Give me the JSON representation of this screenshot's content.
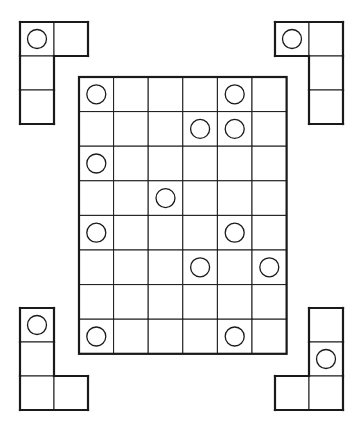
{
  "puzzle": {
    "main_grid": {
      "cols": 6,
      "rows": 8,
      "origin": [
        79,
        77
      ],
      "cell": 34.6,
      "circles": [
        [
          0,
          0
        ],
        [
          4,
          0
        ],
        [
          3,
          1
        ],
        [
          4,
          1
        ],
        [
          0,
          2
        ],
        [
          2,
          3
        ],
        [
          0,
          4
        ],
        [
          4,
          4
        ],
        [
          3,
          5
        ],
        [
          5,
          5
        ],
        [
          0,
          7
        ],
        [
          4,
          7
        ]
      ]
    },
    "pieces": [
      {
        "id": "piece-top-left",
        "origin": [
          20,
          22
        ],
        "cell": 34,
        "cells": [
          [
            0,
            0
          ],
          [
            1,
            0
          ],
          [
            0,
            1
          ],
          [
            0,
            2
          ]
        ],
        "circles": [
          [
            0,
            0
          ]
        ]
      },
      {
        "id": "piece-top-right",
        "origin": [
          275,
          22
        ],
        "cell": 34,
        "cells": [
          [
            0,
            0
          ],
          [
            1,
            0
          ],
          [
            1,
            1
          ],
          [
            1,
            2
          ]
        ],
        "circles": [
          [
            0,
            0
          ]
        ]
      },
      {
        "id": "piece-bottom-left",
        "origin": [
          20,
          308
        ],
        "cell": 34,
        "cells": [
          [
            0,
            0
          ],
          [
            0,
            1
          ],
          [
            0,
            2
          ],
          [
            1,
            2
          ]
        ],
        "circles": [
          [
            0,
            0
          ]
        ]
      },
      {
        "id": "piece-bottom-right",
        "origin": [
          275,
          308
        ],
        "cell": 34,
        "cells": [
          [
            1,
            0
          ],
          [
            1,
            1
          ],
          [
            0,
            2
          ],
          [
            1,
            2
          ]
        ],
        "circles": [
          [
            1,
            1
          ]
        ]
      }
    ],
    "colors": {
      "line": "#1a1a1a",
      "background": "#ffffff"
    }
  }
}
